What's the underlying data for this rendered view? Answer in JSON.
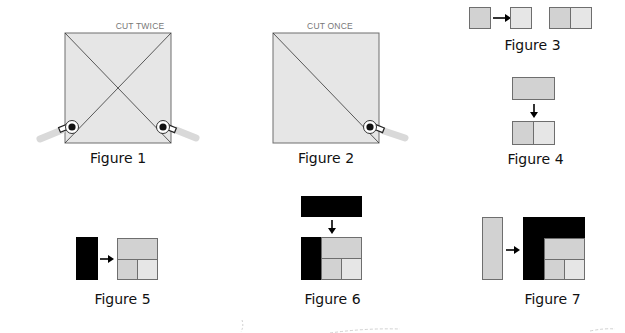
{
  "colors": {
    "fabric_light": "#e6e6e6",
    "fabric_mid": "#d2d2d2",
    "fabric_dark": "#000000",
    "outline": "#6e6e6e",
    "cutter_handle": "#d9d9d9"
  },
  "figures": [
    {
      "id": 1,
      "caption": "Figure 1",
      "label": "CUT TWICE"
    },
    {
      "id": 2,
      "caption": "Figure 2",
      "label": "CUT ONCE"
    },
    {
      "id": 3,
      "caption": "Figure 3"
    },
    {
      "id": 4,
      "caption": "Figure 4"
    },
    {
      "id": 5,
      "caption": "Figure 5"
    },
    {
      "id": 6,
      "caption": "Figure 6"
    },
    {
      "id": 7,
      "caption": "Figure 7"
    }
  ]
}
